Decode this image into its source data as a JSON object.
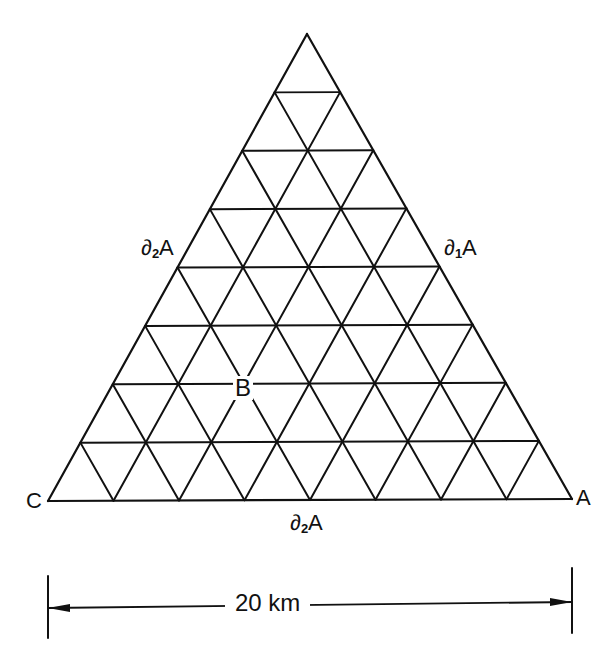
{
  "diagram": {
    "type": "triangular-mesh",
    "subdivisions": 8,
    "vertices": {
      "apex": {
        "x": 307,
        "y": 34
      },
      "left": {
        "x": 48,
        "y": 501,
        "label": "C"
      },
      "right": {
        "x": 572,
        "y": 499,
        "label": "A"
      }
    },
    "stroke_color": "#111111",
    "labels": {
      "corner_c": "C",
      "corner_a": "A",
      "left_side": {
        "base": "∂",
        "sub": "2",
        "tail": "A"
      },
      "right_side": {
        "base": "∂",
        "sub": "1",
        "tail": "A"
      },
      "bottom_side": {
        "base": "∂",
        "sub": "2",
        "tail": "A"
      },
      "node_b": "B"
    },
    "scale_bar": {
      "label": "20 km",
      "left_x": 48,
      "right_x": 572
    }
  }
}
